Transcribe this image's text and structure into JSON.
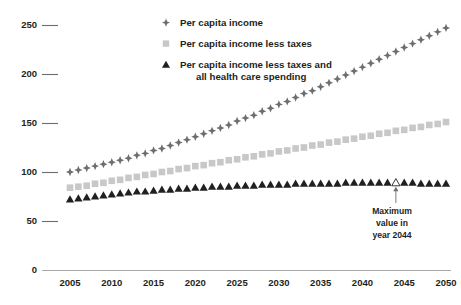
{
  "chart_data": {
    "type": "line",
    "title": "",
    "subtitle": "",
    "xlabel": "",
    "ylabel": "",
    "xlim": [
      2005,
      2050
    ],
    "ylim": [
      0,
      250
    ],
    "grid": false,
    "legend_position": "top-center",
    "x_ticks": [
      "2005",
      "2010",
      "2015",
      "2020",
      "2025",
      "2030",
      "2035",
      "2040",
      "2045",
      "2050"
    ],
    "y_ticks": [
      "0",
      "50",
      "100",
      "150",
      "200",
      "250"
    ],
    "x": [
      2005,
      2006,
      2007,
      2008,
      2009,
      2010,
      2011,
      2012,
      2013,
      2014,
      2015,
      2016,
      2017,
      2018,
      2019,
      2020,
      2021,
      2022,
      2023,
      2024,
      2025,
      2026,
      2027,
      2028,
      2029,
      2030,
      2031,
      2032,
      2033,
      2034,
      2035,
      2036,
      2037,
      2038,
      2039,
      2040,
      2041,
      2042,
      2043,
      2044,
      2045,
      2046,
      2047,
      2048,
      2049,
      2050
    ],
    "series": [
      {
        "name": "Per capita income",
        "marker": "diamond",
        "color": "#6d6e71",
        "values": [
          100,
          102,
          104,
          106,
          108,
          110,
          112,
          114,
          117,
          119,
          122,
          124,
          127,
          130,
          133,
          136,
          139,
          142,
          145,
          148,
          152,
          155,
          158,
          162,
          165,
          169,
          172,
          176,
          180,
          183,
          187,
          191,
          195,
          199,
          203,
          207,
          211,
          215,
          219,
          223,
          227,
          231,
          235,
          239,
          243,
          247
        ]
      },
      {
        "name": "Per capita income less taxes",
        "marker": "square",
        "color": "#c7c8ca",
        "values": [
          84,
          85,
          86,
          88,
          89,
          91,
          92,
          94,
          95,
          97,
          98,
          100,
          101,
          103,
          104,
          106,
          107,
          109,
          110,
          112,
          113,
          115,
          116,
          118,
          119,
          121,
          122,
          124,
          125,
          127,
          128,
          130,
          131,
          133,
          134,
          136,
          137,
          139,
          140,
          142,
          143,
          145,
          146,
          148,
          149,
          151
        ]
      },
      {
        "name": "Per capita income less taxes and all health care spending",
        "marker": "triangle",
        "color": "#231f20",
        "values": [
          72,
          73,
          74,
          75,
          76,
          77,
          78,
          79,
          80,
          80,
          81,
          82,
          82,
          83,
          83,
          84,
          84,
          85,
          85,
          85,
          86,
          86,
          86,
          87,
          87,
          87,
          87,
          88,
          88,
          88,
          88,
          88,
          88,
          89,
          89,
          89,
          89,
          89,
          89,
          89,
          89,
          89,
          88,
          88,
          88,
          88
        ]
      }
    ],
    "highlight": {
      "series": "Per capita income less taxes and all health care spending",
      "x": 2044,
      "marker": "hollow-triangle"
    },
    "annotations": [
      {
        "name": "maximum-value-callout",
        "lines": [
          "Maximum",
          "value in",
          "year 2044"
        ],
        "points_to_x": 2044
      }
    ]
  },
  "legend": {
    "items": [
      {
        "label": "Per capita income",
        "label2": ""
      },
      {
        "label": "Per capita income less taxes",
        "label2": ""
      },
      {
        "label": "Per capita income less taxes and",
        "label2": "all health care spending"
      }
    ]
  },
  "annotation": {
    "line1": "Maximum",
    "line2": "value in",
    "line3": "year 2044"
  },
  "colors": {
    "series1": "#6d6e71",
    "series2": "#c7c8ca",
    "series3": "#231f20",
    "axis": "#a7a9ac",
    "text": "#231f20"
  }
}
